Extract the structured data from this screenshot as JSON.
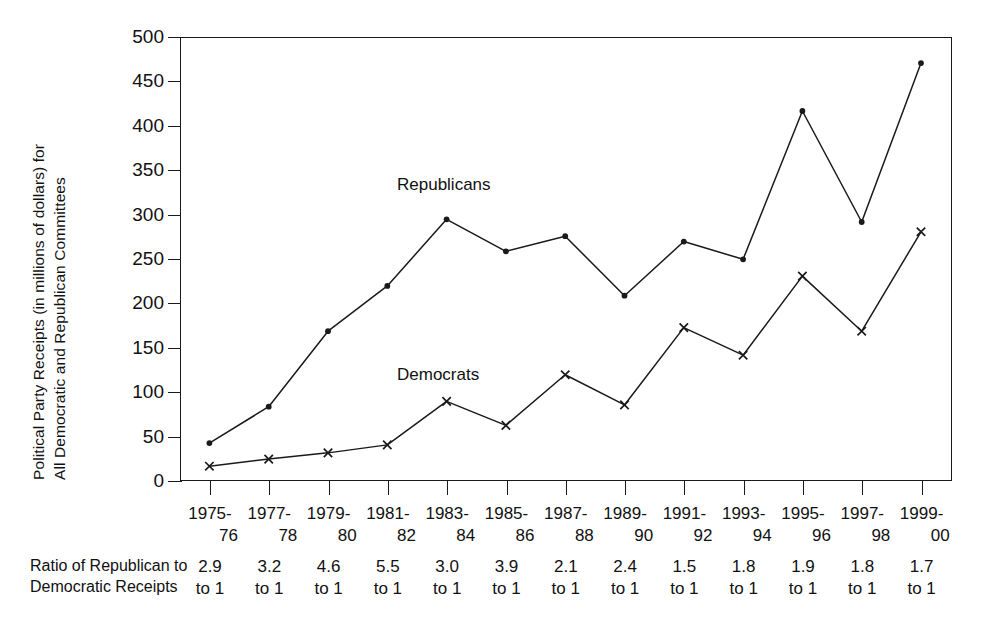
{
  "chart_data": {
    "type": "line",
    "title": "",
    "ylabel_line1": "Political Party Receipts (in millions of dollars) for",
    "ylabel_line2": "All Democratic and Republican Committees",
    "xlabel": "",
    "ylim": [
      0,
      500
    ],
    "yticks": [
      0,
      50,
      100,
      150,
      200,
      250,
      300,
      350,
      400,
      450,
      500
    ],
    "ytick_labels": [
      "0",
      "50",
      "100",
      "150",
      "200",
      "250",
      "300",
      "350",
      "400",
      "450",
      "500"
    ],
    "grid": false,
    "legend_position": "inline-annotation",
    "categories": [
      "1975-76",
      "1977-78",
      "1979-80",
      "1981-82",
      "1983-84",
      "1985-86",
      "1987-88",
      "1989-90",
      "1991-92",
      "1993-94",
      "1995-96",
      "1997-98",
      "1999-00"
    ],
    "category_lines": [
      {
        "l1": "1975-",
        "l2": "76"
      },
      {
        "l1": "1977-",
        "l2": "78"
      },
      {
        "l1": "1979-",
        "l2": "80"
      },
      {
        "l1": "1981-",
        "l2": "82"
      },
      {
        "l1": "1983-",
        "l2": "84"
      },
      {
        "l1": "1985-",
        "l2": "86"
      },
      {
        "l1": "1987-",
        "l2": "88"
      },
      {
        "l1": "1989-",
        "l2": "90"
      },
      {
        "l1": "1991-",
        "l2": "92"
      },
      {
        "l1": "1993-",
        "l2": "94"
      },
      {
        "l1": "1995-",
        "l2": "96"
      },
      {
        "l1": "1997-",
        "l2": "98"
      },
      {
        "l1": "1999-",
        "l2": "00"
      }
    ],
    "series": [
      {
        "name": "Republicans",
        "marker": "filled-circle",
        "color": "#1a1a1a",
        "values": [
          42,
          83,
          168,
          219,
          294,
          258,
          275,
          208,
          269,
          249,
          416,
          291,
          470
        ]
      },
      {
        "name": "Democrats",
        "marker": "cross-x",
        "color": "#1a1a1a",
        "values": [
          16,
          24,
          31,
          40,
          89,
          62,
          119,
          85,
          172,
          141,
          230,
          168,
          280
        ]
      }
    ],
    "annotations": [
      {
        "text": "Republicans",
        "series": "Republicans"
      },
      {
        "text": "Democrats",
        "series": "Democrats"
      }
    ]
  },
  "ratio_table": {
    "row_label_line1": "Ratio of Republican to",
    "row_label_line2": "Democratic Receipts",
    "suffix": "to 1",
    "values": [
      "2.9",
      "3.2",
      "4.6",
      "5.5",
      "3.0",
      "3.9",
      "2.1",
      "2.4",
      "1.5",
      "1.8",
      "1.9",
      "1.8",
      "1.7"
    ],
    "cells": [
      {
        "v1": "2.9",
        "v2": "to 1"
      },
      {
        "v1": "3.2",
        "v2": "to 1"
      },
      {
        "v1": "4.6",
        "v2": "to 1"
      },
      {
        "v1": "5.5",
        "v2": "to 1"
      },
      {
        "v1": "3.0",
        "v2": "to 1"
      },
      {
        "v1": "3.9",
        "v2": "to 1"
      },
      {
        "v1": "2.1",
        "v2": "to 1"
      },
      {
        "v1": "2.4",
        "v2": "to 1"
      },
      {
        "v1": "1.5",
        "v2": "to 1"
      },
      {
        "v1": "1.8",
        "v2": "to 1"
      },
      {
        "v1": "1.9",
        "v2": "to 1"
      },
      {
        "v1": "1.8",
        "v2": "to 1"
      },
      {
        "v1": "1.7",
        "v2": "to 1"
      }
    ]
  }
}
